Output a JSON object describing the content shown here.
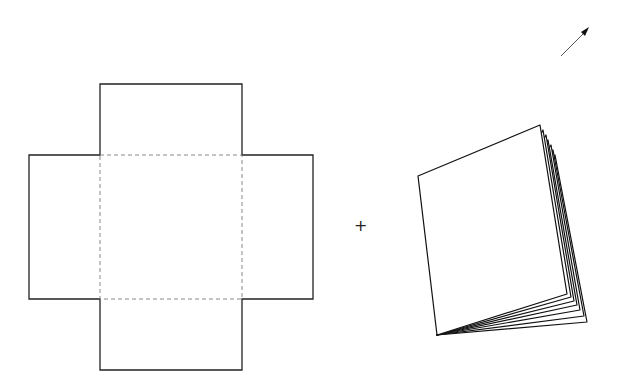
{
  "diagram": {
    "operator": "+",
    "net": {
      "shape": "cross",
      "fold_lines": "dashed",
      "flaps": [
        "top",
        "left",
        "right",
        "bottom"
      ],
      "base": "center-square"
    },
    "booklet": {
      "visible_page_edges": 7
    },
    "arrow": {
      "direction": "up-right"
    },
    "colors": {
      "stroke": "#111111",
      "fold_line": "#777777",
      "background": "#ffffff"
    }
  }
}
